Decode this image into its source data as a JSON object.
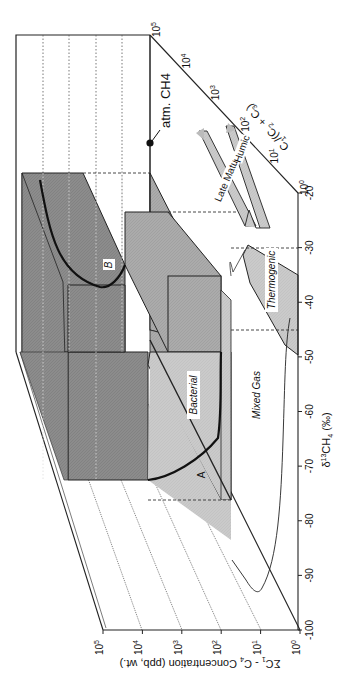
{
  "figure": {
    "x_axis": {
      "label_main": "δ",
      "label_sup": "13",
      "label_rest": "CH",
      "label_sub": "4",
      "label_unit": "(‰)",
      "ticks": [
        "-20",
        "-30",
        "-40",
        "-50",
        "-60",
        "-70",
        "-80",
        "-90",
        "-100"
      ],
      "range": [
        -100,
        -20
      ]
    },
    "y_axis": {
      "label_sigma": "ΣC",
      "label_sub1": "1",
      "label_rest": " - C",
      "label_sub2": "4",
      "label_unit": " Concentration (ppb, wt.)",
      "ticks": [
        {
          "base": "10",
          "exp": "0"
        },
        {
          "base": "10",
          "exp": "1"
        },
        {
          "base": "10",
          "exp": "2"
        },
        {
          "base": "10",
          "exp": "3"
        },
        {
          "base": "10",
          "exp": "4"
        },
        {
          "base": "10",
          "exp": "5"
        }
      ]
    },
    "z_axis": {
      "label": "C1/(C2 + C3)",
      "label_parts": {
        "c1": "C",
        "s1": "1",
        "mid": "/(C",
        "s2": "2",
        "plus": " + C",
        "s3": "3",
        "end": ")"
      },
      "ticks": [
        {
          "base": "10",
          "exp": "0"
        },
        {
          "base": "10",
          "exp": "1"
        },
        {
          "base": "10",
          "exp": "2"
        },
        {
          "base": "10",
          "exp": "3"
        },
        {
          "base": "10",
          "exp": "4"
        },
        {
          "base": "10",
          "exp": "5"
        }
      ]
    },
    "regions": {
      "bacterial": "Bacterial",
      "thermogenic": "Thermogenic",
      "mixed_gas": "Mixed Gas",
      "late_mature": "Late Mature",
      "humic": "Humic"
    },
    "markers": {
      "atm": "atm. CH4",
      "curve_a": "A",
      "curve_b": "B"
    },
    "colors": {
      "dark_fill": "#8a8a8a",
      "mid_fill": "#a9a9a9",
      "light_fill": "#c8c8c8",
      "line": "#222222"
    }
  }
}
